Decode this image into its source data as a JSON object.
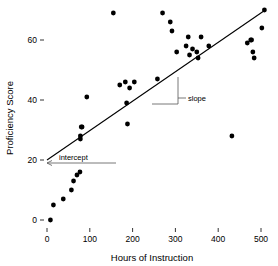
{
  "chart_data": {
    "type": "scatter",
    "title": "",
    "xlabel": "Hours of Instruction",
    "ylabel": "Proficiency Score",
    "xlim": [
      -30,
      530
    ],
    "ylim": [
      -6,
      74
    ],
    "xticks": [
      0,
      100,
      200,
      300,
      400,
      500
    ],
    "xticklabels": [
      "0",
      "100",
      "200",
      "300",
      "400",
      "500"
    ],
    "yticks": [
      0,
      20,
      40,
      60
    ],
    "yticklabels": [
      "0",
      "20",
      "40",
      "60"
    ],
    "grid": false,
    "legend": null,
    "series": [
      {
        "name": "observations",
        "marker": "filled-circle",
        "color": "#000000",
        "points": [
          [
            8,
            0
          ],
          [
            15,
            5
          ],
          [
            38,
            7
          ],
          [
            57,
            10
          ],
          [
            62,
            13
          ],
          [
            70,
            15
          ],
          [
            77,
            16
          ],
          [
            78,
            27
          ],
          [
            78,
            28
          ],
          [
            80,
            31
          ],
          [
            82,
            31
          ],
          [
            93,
            41
          ],
          [
            155,
            69
          ],
          [
            170,
            45
          ],
          [
            183,
            46
          ],
          [
            186,
            39
          ],
          [
            188,
            32
          ],
          [
            193,
            44
          ],
          [
            204,
            46
          ],
          [
            258,
            47
          ],
          [
            270,
            69
          ],
          [
            288,
            66
          ],
          [
            292,
            63
          ],
          [
            303,
            56
          ],
          [
            325,
            58
          ],
          [
            330,
            61
          ],
          [
            333,
            55
          ],
          [
            340,
            57
          ],
          [
            350,
            56
          ],
          [
            353,
            54
          ],
          [
            360,
            61
          ],
          [
            378,
            58
          ],
          [
            432,
            28
          ],
          [
            468,
            59
          ],
          [
            476,
            60
          ],
          [
            478,
            60
          ],
          [
            481,
            56
          ],
          [
            484,
            54
          ],
          [
            502,
            64
          ],
          [
            508,
            70
          ]
        ]
      }
    ],
    "fit_line": {
      "name": "regression-line",
      "x_start": 0,
      "y_start": 20,
      "x_end": 510,
      "y_end": 70,
      "color": "#000000"
    },
    "annotations": [
      {
        "name": "intercept",
        "label": "intercept",
        "target_x": 0,
        "target_y": 20,
        "style": "leader-line-with-arrow"
      },
      {
        "name": "slope",
        "label": "slope",
        "style": "right-triangle-marker",
        "tri_x0": 245,
        "tri_x1": 308,
        "tri_y0": 37,
        "tri_y1": 49
      }
    ]
  },
  "labels": {
    "x_axis": "Hours of Instruction",
    "y_axis": "Proficiency Score",
    "intercept": "intercept",
    "slope": "slope"
  }
}
